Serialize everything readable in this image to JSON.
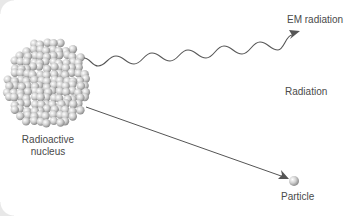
{
  "diagram": {
    "labels": {
      "em_radiation": "EM radiation",
      "radiation": "Radiation",
      "nucleus_line1": "Radioactive",
      "nucleus_line2": "nucleus",
      "particle": "Particle"
    },
    "nodes": [
      {
        "id": "nucleus",
        "label": "Radioactive nucleus",
        "shape": "sphere-cluster"
      },
      {
        "id": "em",
        "label": "EM radiation",
        "connection": "wavy-arrow"
      },
      {
        "id": "particle",
        "label": "Particle",
        "connection": "straight-arrow"
      }
    ],
    "colors": {
      "line": "#555555",
      "text": "#4a4a4a",
      "sphere": "#c8c8c8"
    }
  }
}
